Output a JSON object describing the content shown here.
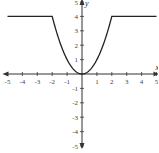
{
  "chart_data": {
    "type": "line",
    "title": "",
    "xlabel": "x",
    "ylabel": "y",
    "xlim": [
      -5,
      5
    ],
    "ylim": [
      -5,
      5
    ],
    "grid": false,
    "legend": null,
    "x_ticks": [
      -5,
      -4,
      -3,
      -2,
      -1,
      1,
      2,
      3,
      4,
      5
    ],
    "y_ticks": [
      -5,
      -4,
      -3,
      -2,
      -1,
      1,
      2,
      3,
      4,
      5
    ],
    "series": [
      {
        "name": "piecewise f(x)",
        "definition": "f(x) = 4 for x < -2; x^2 for -2 <= x <= 2; 4 for x > 2",
        "x": [
          -5,
          -4,
          -3,
          -2,
          -1.5,
          -1,
          -0.5,
          0,
          0.5,
          1,
          1.5,
          2,
          3,
          4,
          5
        ],
        "y": [
          4,
          4,
          4,
          4,
          2.25,
          1,
          0.25,
          0,
          0.25,
          1,
          2.25,
          4,
          4,
          4,
          4
        ]
      }
    ],
    "colors": {
      "axis": "#333333",
      "curve": "#222222"
    }
  }
}
